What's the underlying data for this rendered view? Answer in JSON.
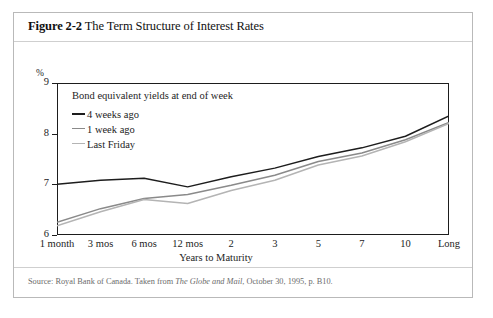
{
  "figure": {
    "number": "Figure 2-2",
    "title": "The Term Structure of Interest Rates",
    "source": "Source: Royal Bank of Canada. Taken from ",
    "source_italic": "The Globe and Mail",
    "source_tail": ", October 30, 1995, p. B10."
  },
  "chart_data": {
    "type": "line",
    "title": "Bond equivalent yields at end of week",
    "xlabel": "Years to Maturity",
    "ylabel": "%",
    "ylim": [
      6,
      9
    ],
    "yticks": [
      6,
      7,
      8,
      9
    ],
    "ytick_labels": [
      "6",
      "7",
      "8",
      "9"
    ],
    "grid": false,
    "legend_position": "top-left",
    "categories": [
      "1 month",
      "3 mos",
      "6 mos",
      "12 mos",
      "2",
      "3",
      "5",
      "7",
      "10",
      "Long"
    ],
    "series": [
      {
        "name": "4 weeks ago",
        "color": "#1d1d1d",
        "width": 1.5,
        "values": [
          7.0,
          7.08,
          7.12,
          6.95,
          7.15,
          7.32,
          7.55,
          7.72,
          7.95,
          8.35
        ]
      },
      {
        "name": "1 week ago",
        "color": "#8a8a8a",
        "width": 1.5,
        "values": [
          6.25,
          6.52,
          6.72,
          6.8,
          6.98,
          7.18,
          7.45,
          7.62,
          7.88,
          8.22
        ]
      },
      {
        "name": "Last Friday",
        "color": "#b4b4b4",
        "width": 1.5,
        "values": [
          6.18,
          6.46,
          6.7,
          6.62,
          6.88,
          7.08,
          7.38,
          7.56,
          7.84,
          8.2
        ]
      }
    ]
  },
  "colors": {
    "frame": "#1d1d1d",
    "card_border": "#b9b9b9",
    "rule": "#cfcfcf",
    "source_text": "#6b6b6b"
  }
}
